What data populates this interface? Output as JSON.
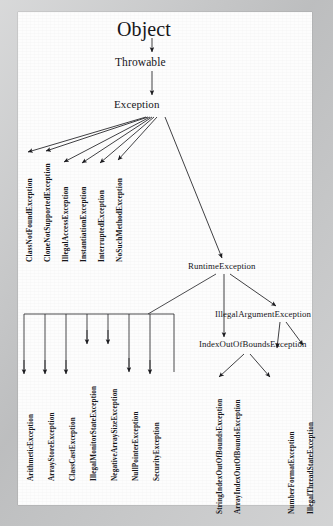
{
  "document": {
    "kind": "scanned-book-page",
    "title": "Java Exception class hierarchy diagram",
    "paper_color": "#fdfdfd",
    "border_color": "#c6c7c8",
    "ink_color": "#16161a"
  },
  "diagram": {
    "type": "tree",
    "root": "Object",
    "nodes": {
      "object": {
        "label": "Object",
        "x": 152,
        "y": 30,
        "orientation": "horizontal",
        "level": 0
      },
      "throwable": {
        "label": "Throwable",
        "x": 152,
        "y": 63,
        "orientation": "horizontal",
        "level": 1
      },
      "exception": {
        "label": "Exception",
        "x": 152,
        "y": 105,
        "orientation": "horizontal",
        "level": 2
      },
      "runtime_exception": {
        "label": "RuntimeException",
        "x": 221,
        "y": 267,
        "orientation": "horizontal",
        "level": 3
      },
      "illegal_argument_exception": {
        "label": "IllegalArgumentException",
        "x": 286,
        "y": 315,
        "orientation": "horizontal",
        "level": 4
      },
      "index_out_of_bounds_exception": {
        "label": "IndexOutOfBoundsException",
        "x": 248,
        "y": 345,
        "orientation": "horizontal",
        "level": 4
      }
    },
    "checked_exception_children": [
      {
        "label": "ClassNotFoundException",
        "x": 25,
        "y": 260
      },
      {
        "label": "CloneNotSupportedException",
        "x": 43,
        "y": 260
      },
      {
        "label": "IllegalAccessException",
        "x": 61,
        "y": 260
      },
      {
        "label": "InstantiationException",
        "x": 79,
        "y": 260
      },
      {
        "label": "InterruptedException",
        "x": 97,
        "y": 260
      },
      {
        "label": "NoSuchMethodException",
        "x": 115,
        "y": 260
      }
    ],
    "runtime_exception_children": [
      {
        "label": "ArithmeticException",
        "x": 27,
        "y": 479
      },
      {
        "label": "ArrayStoreException",
        "x": 48,
        "y": 479
      },
      {
        "label": "ClassCastException",
        "x": 69,
        "y": 479
      },
      {
        "label": "IllegalMonitorStateException",
        "x": 90,
        "y": 479
      },
      {
        "label": "NegativeArraySizeException",
        "x": 111,
        "y": 479
      },
      {
        "label": "NullPointerException",
        "x": 132,
        "y": 479
      },
      {
        "label": "SecurityException",
        "x": 153,
        "y": 479
      }
    ],
    "index_out_of_bounds_children": [
      {
        "label": "StringIndexOutOfBoundsException",
        "x": 216,
        "y": 512
      },
      {
        "label": "ArrayIndexOutOfBoundsException",
        "x": 234,
        "y": 512
      }
    ],
    "illegal_argument_children": [
      {
        "label": "NumberFormatException",
        "x": 288,
        "y": 512
      },
      {
        "label": "IllegalThreadStateException",
        "x": 307,
        "y": 512
      }
    ]
  }
}
